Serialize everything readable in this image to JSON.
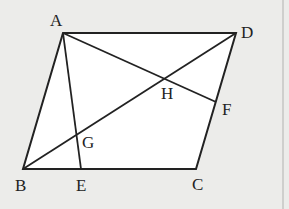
{
  "diagram": {
    "type": "parallelogram-geometry",
    "points": {
      "A": {
        "label": "A",
        "x": 63,
        "y": 33
      },
      "B": {
        "label": "B",
        "x": 23,
        "y": 169
      },
      "C": {
        "label": "C",
        "x": 196,
        "y": 169
      },
      "D": {
        "label": "D",
        "x": 236,
        "y": 33
      },
      "E": {
        "label": "E",
        "x": 81,
        "y": 169
      },
      "F": {
        "label": "F",
        "x": 216,
        "y": 102
      },
      "G": {
        "label": "G",
        "x": 77,
        "y": 136
      },
      "H": {
        "label": "H",
        "x": 167,
        "y": 78
      }
    },
    "segments": [
      "AB",
      "BC",
      "CD",
      "DA",
      "AE",
      "AF",
      "BD"
    ],
    "colors": {
      "background": "#ececea",
      "fill": "#ffffff",
      "stroke": "#222222"
    }
  }
}
